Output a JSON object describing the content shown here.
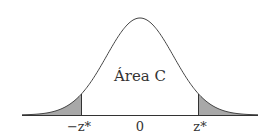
{
  "diagram": {
    "type": "normal-distribution-curve",
    "center_label": "Área C",
    "tick_labels": {
      "left": "−z*",
      "center": "0",
      "right": "z*"
    },
    "colors": {
      "curve": "#444444",
      "axis": "#333333",
      "tail_fill": "#a8a8a8",
      "text": "#333333"
    }
  },
  "chart_data": {
    "type": "area",
    "title": "",
    "curve": "standard normal density",
    "annotation": "Área C",
    "shaded_regions": [
      "left tail below −z*",
      "right tail above z*"
    ],
    "x_ticks": [
      "−z*",
      "0",
      "z*"
    ],
    "xlabel": "",
    "ylabel": "",
    "grid": false
  }
}
